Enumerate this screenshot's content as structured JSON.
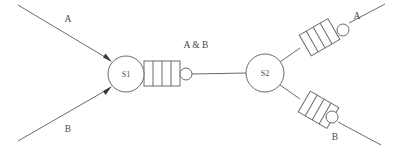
{
  "diagram": {
    "background_color": "#ffffff",
    "stroke_color": "#6a6a6a",
    "text_color": "#4a4a4a",
    "width": 393,
    "height": 150,
    "nodes": [
      {
        "id": "S1",
        "label": "S1",
        "cx": 126,
        "cy": 74,
        "r": 18
      },
      {
        "id": "S2",
        "label": "S2",
        "cx": 265,
        "cy": 73,
        "r": 19
      }
    ],
    "labels": [
      {
        "id": "input-a",
        "text": "A",
        "x": 68,
        "y": 22
      },
      {
        "id": "input-b",
        "text": "B",
        "x": 68,
        "y": 132
      },
      {
        "id": "combined",
        "text": "A & B",
        "x": 192,
        "y": 48
      },
      {
        "id": "output-a",
        "text": "A",
        "x": 357,
        "y": 19
      },
      {
        "id": "output-b",
        "text": "B",
        "x": 335,
        "y": 140
      }
    ],
    "ladders": [
      {
        "id": "ladder-s1",
        "cells": 4,
        "orientation": "horizontal",
        "bubble": true
      },
      {
        "id": "ladder-out-a",
        "cells": 4,
        "orientation": "diagonal-up",
        "bubble": true
      },
      {
        "id": "ladder-out-b",
        "cells": 4,
        "orientation": "diagonal-down",
        "bubble": true
      }
    ],
    "edges": [
      {
        "id": "edge-input-a",
        "from": "input-a",
        "to": "S1",
        "arrow": true
      },
      {
        "id": "edge-input-b",
        "from": "input-b",
        "to": "S1",
        "arrow": true
      },
      {
        "id": "edge-s1-s2",
        "from": "S1",
        "to": "S2",
        "arrow": false
      },
      {
        "id": "edge-s2-out-a",
        "from": "S2",
        "to": "output-a",
        "arrow": false
      },
      {
        "id": "edge-s2-out-b",
        "from": "S2",
        "to": "output-b",
        "arrow": false
      }
    ]
  }
}
